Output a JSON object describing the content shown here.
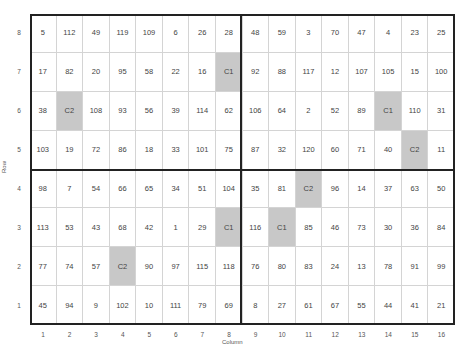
{
  "chart_data": {
    "type": "table",
    "title": "",
    "xlabel": "Column",
    "ylabel": "Row",
    "x_ticks": [
      "1",
      "2",
      "3",
      "4",
      "5",
      "6",
      "7",
      "8",
      "9",
      "10",
      "11",
      "12",
      "13",
      "14",
      "15",
      "16"
    ],
    "y_ticks": [
      "8",
      "7",
      "6",
      "5",
      "4",
      "3",
      "2",
      "1"
    ],
    "highlight_color": "#c8c8c8",
    "quadrant_dividers": {
      "after_column": 8,
      "after_row": 4
    },
    "rows": [
      {
        "row": "8",
        "cells": [
          "5",
          "112",
          "49",
          "119",
          "109",
          "6",
          "26",
          "28",
          "48",
          "59",
          "3",
          "70",
          "47",
          "4",
          "23",
          "25"
        ]
      },
      {
        "row": "7",
        "cells": [
          "17",
          "82",
          "20",
          "95",
          "58",
          "22",
          "16",
          "C1",
          "92",
          "88",
          "117",
          "12",
          "107",
          "105",
          "15",
          "100"
        ]
      },
      {
        "row": "6",
        "cells": [
          "38",
          "C2",
          "108",
          "93",
          "56",
          "39",
          "114",
          "62",
          "106",
          "64",
          "2",
          "52",
          "89",
          "C1",
          "110",
          "31"
        ]
      },
      {
        "row": "5",
        "cells": [
          "103",
          "19",
          "72",
          "86",
          "18",
          "33",
          "101",
          "75",
          "87",
          "32",
          "120",
          "60",
          "71",
          "40",
          "C2",
          "11"
        ]
      },
      {
        "row": "4",
        "cells": [
          "98",
          "7",
          "54",
          "66",
          "65",
          "34",
          "51",
          "104",
          "35",
          "81",
          "C2",
          "96",
          "14",
          "37",
          "63",
          "50"
        ]
      },
      {
        "row": "3",
        "cells": [
          "113",
          "53",
          "43",
          "68",
          "42",
          "1",
          "29",
          "C1",
          "116",
          "C1",
          "85",
          "46",
          "73",
          "30",
          "36",
          "84"
        ]
      },
      {
        "row": "2",
        "cells": [
          "77",
          "74",
          "57",
          "C2",
          "90",
          "97",
          "115",
          "118",
          "76",
          "80",
          "83",
          "24",
          "13",
          "78",
          "91",
          "99"
        ]
      },
      {
        "row": "1",
        "cells": [
          "45",
          "94",
          "9",
          "102",
          "10",
          "111",
          "79",
          "69",
          "8",
          "27",
          "61",
          "67",
          "55",
          "44",
          "41",
          "21"
        ]
      }
    ]
  }
}
